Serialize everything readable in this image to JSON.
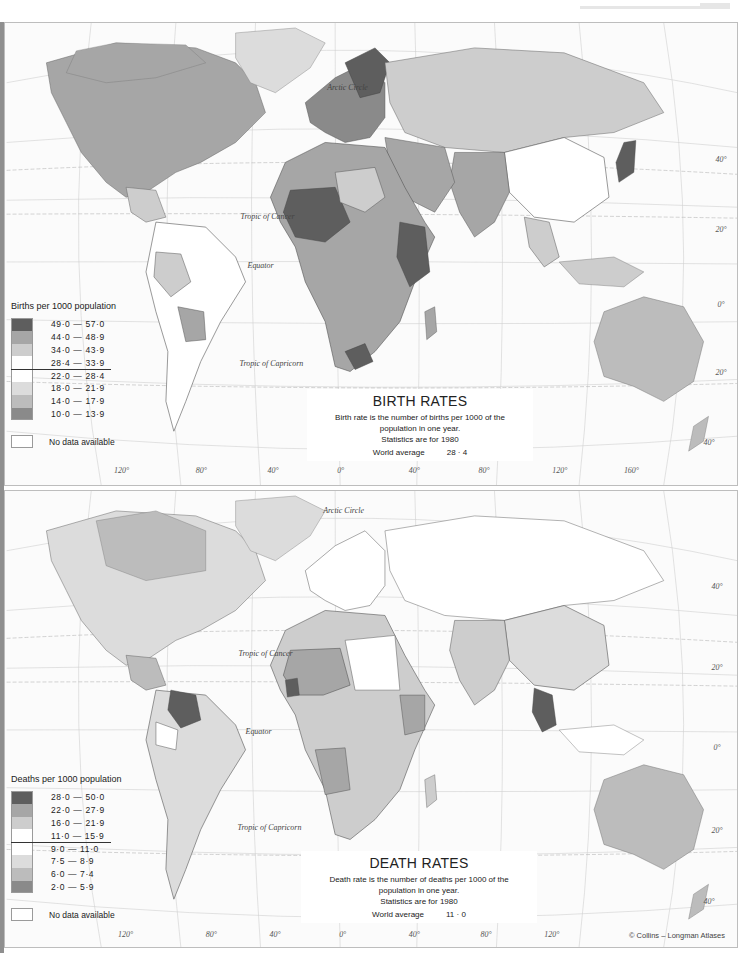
{
  "page": {
    "copyright": "© Collins – Longman Atlases"
  },
  "birth_map": {
    "title": "BIRTH RATES",
    "description_line1": "Birth rate is the number of births per 1000 of the",
    "description_line2": "population in one year.",
    "statistics_year": "Statistics are for 1980",
    "world_average_label": "World average",
    "world_average_value": "28 · 4",
    "legend": {
      "title": "Births per 1000 population",
      "items": [
        {
          "range": "49·0 — 57·0",
          "color": "#5e5e5e"
        },
        {
          "range": "44·0 — 48·9",
          "color": "#a6a6a6"
        },
        {
          "range": "34·0 — 43·9",
          "color": "#cdcdcd"
        },
        {
          "range": "28·4 — 33·9",
          "color": "#ffffff"
        },
        {
          "range": "22·0 — 28·4",
          "color": "#ffffff"
        },
        {
          "range": "18·0 — 21·9",
          "color": "#dcdcdc"
        },
        {
          "range": "14·0 — 17·9",
          "color": "#bcbcbc"
        },
        {
          "range": "10·0 — 13·9",
          "color": "#8a8a8a"
        }
      ],
      "divider_after_index": 3,
      "no_data_label": "No data available"
    },
    "parallels": {
      "arctic": "Arctic Circle",
      "cancer": "Tropic of Cancer",
      "equator": "Equator",
      "capricorn": "Tropic of Capricorn"
    },
    "lat_labels": [
      "40°",
      "20°",
      "0°",
      "20°",
      "40°"
    ],
    "lon_labels": [
      "120°",
      "80°",
      "40°",
      "0°",
      "40°",
      "80°",
      "120°",
      "160°"
    ]
  },
  "death_map": {
    "title": "DEATH RATES",
    "description_line1": "Death rate is the number of deaths per 1000 of the",
    "description_line2": "population in one year.",
    "statistics_year": "Statistics are for 1980",
    "world_average_label": "World average",
    "world_average_value": "11 · 0",
    "legend": {
      "title": "Deaths per 1000 population",
      "items": [
        {
          "range": "28·0 — 50·0",
          "color": "#5e5e5e"
        },
        {
          "range": "22·0 — 27·9",
          "color": "#a6a6a6"
        },
        {
          "range": "16·0 — 21·9",
          "color": "#cdcdcd"
        },
        {
          "range": "11·0 — 15·9",
          "color": "#ffffff"
        },
        {
          "range": "9·0 — 11·0",
          "color": "#ffffff"
        },
        {
          "range": "7·5 — 8·9",
          "color": "#dcdcdc"
        },
        {
          "range": "6·0 — 7·4",
          "color": "#bcbcbc"
        },
        {
          "range": "2·0 — 5·9",
          "color": "#8a8a8a"
        }
      ],
      "divider_after_index": 3,
      "no_data_label": "No data available"
    },
    "parallels": {
      "arctic": "Arctic Circle",
      "cancer": "Tropic of Cancer",
      "equator": "Equator",
      "capricorn": "Tropic of Capricorn"
    },
    "lat_labels": [
      "40°",
      "20°",
      "0°",
      "20°",
      "40°"
    ],
    "lon_labels": [
      "120°",
      "80°",
      "40°",
      "0°",
      "40°",
      "80°",
      "120°"
    ]
  }
}
